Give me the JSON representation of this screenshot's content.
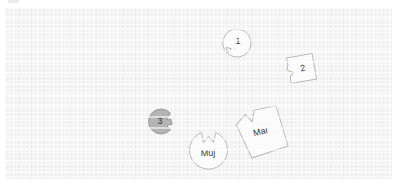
{
  "canvas": {
    "background_color": "#f1f1f1",
    "grid": "on",
    "shapes": [
      {
        "id": "shape-1",
        "label": "1",
        "kind": "notched-circle",
        "fill": "#fbfbfb",
        "stroke": "#b9b9b9",
        "x": 217,
        "y": 20,
        "size": 30,
        "notch": "lower-left"
      },
      {
        "id": "shape-2",
        "label": "2",
        "kind": "notched-polygon",
        "fill": "#fbfbfb",
        "stroke": "#b9b9b9",
        "x": 281,
        "y": 45,
        "size": 31,
        "notch": "left",
        "rotation": "-12deg"
      },
      {
        "id": "shape-3",
        "label": "3",
        "kind": "notched-circle",
        "fill": "#b4b4b4",
        "stroke": "#9a9a9a",
        "x": 143,
        "y": 100,
        "size": 27,
        "notch": "right"
      },
      {
        "id": "shape-mar",
        "label": "Mar",
        "kind": "notched-polygon",
        "fill": "#fbfbfb",
        "stroke": "#b9b9b9",
        "x": 231,
        "y": 99,
        "size": 51,
        "notch": "top",
        "rotation": "-14deg"
      },
      {
        "id": "shape-muj",
        "label": "Muj",
        "kind": "notched-circle",
        "fill": "#fbfbfb",
        "stroke": "#b9b9b9",
        "x": 183,
        "y": 122,
        "size": 41,
        "notch": "top"
      }
    ]
  }
}
